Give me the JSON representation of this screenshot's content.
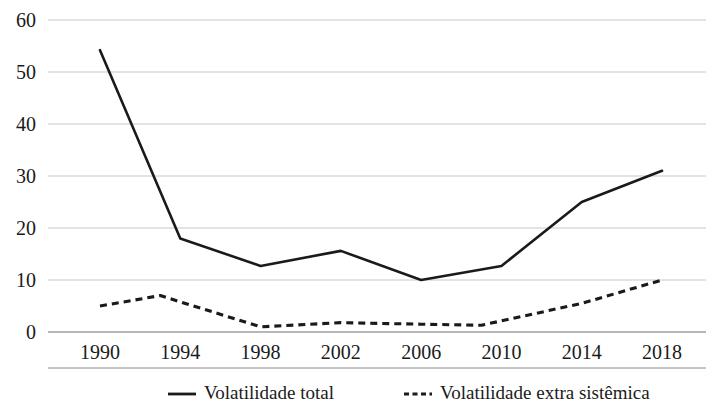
{
  "chart_data": {
    "type": "line",
    "title": "",
    "subtitle": "",
    "xlabel": "",
    "ylabel": "",
    "xlim": [
      1990,
      2018
    ],
    "ylim": [
      0,
      60
    ],
    "y_ticks": [
      0,
      10,
      20,
      30,
      40,
      50,
      60
    ],
    "x_ticks": [
      1990,
      1994,
      1998,
      2002,
      2006,
      2010,
      2014,
      2018
    ],
    "x_tick_labels": [
      "1990",
      "1994",
      "1998",
      "2002",
      "2006",
      "2010",
      "2014",
      "2018"
    ],
    "y_tick_labels": [
      "0",
      "10",
      "20",
      "30",
      "40",
      "50",
      "60"
    ],
    "grid": "horizontal",
    "legend_position": "bottom",
    "x": [
      1990,
      1994,
      1998,
      2002,
      2006,
      2010,
      2014,
      2018
    ],
    "series": [
      {
        "name": "Volatilidade total",
        "style": "solid",
        "color": "#1a1a1a",
        "x": [
          1990,
          1994,
          1998,
          2002,
          2006,
          2010,
          2014,
          2018
        ],
        "values": [
          54.2,
          18.0,
          12.7,
          15.6,
          10.0,
          12.7,
          25.0,
          31.0
        ]
      },
      {
        "name": "Volatilidade extra sistêmica",
        "style": "dashed",
        "color": "#1a1a1a",
        "x": [
          1990,
          1993,
          1998,
          2002,
          2006,
          2009,
          2014,
          2018
        ],
        "values": [
          5.0,
          7.0,
          1.0,
          1.8,
          1.5,
          1.3,
          5.5,
          10.0
        ]
      }
    ]
  },
  "legend": {
    "items": [
      {
        "label": "Volatilidade total",
        "style": "solid"
      },
      {
        "label": "Volatilidade extra sistêmica",
        "style": "dashed"
      }
    ]
  }
}
